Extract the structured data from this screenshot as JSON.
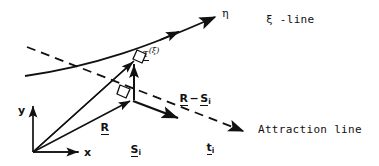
{
  "figure": {
    "background_color": "#ffffff",
    "stroke_color": "#111111",
    "width": 379,
    "height": 166
  },
  "labels": {
    "eta": "η",
    "xi_line": "ξ -line",
    "attraction_line": "Attraction line",
    "tau_xi_base": "τ",
    "tau_xi_sup": "(ξ)",
    "r_minus_si_r": "R",
    "r_minus_si_minus": "−",
    "r_minus_si_s": "S",
    "r_minus_si_sub": "i",
    "r_vector": "R",
    "s_vector": "S",
    "s_vector_sub": "i",
    "t_vector": "t",
    "t_vector_sub": "i",
    "axis_x": "x",
    "axis_y": "y"
  },
  "geometry": {
    "origin": {
      "x": 33,
      "y": 152
    },
    "xi_line_curve": {
      "start": {
        "x": 25,
        "y": 76
      },
      "control1": {
        "x": 95,
        "y": 66
      },
      "control2": {
        "x": 150,
        "y": 46
      },
      "end": {
        "x": 218,
        "y": 16
      },
      "mid_arrow_at": {
        "x": 178,
        "y": 33
      },
      "end_arrow_label": "η"
    },
    "attraction_line_dashed": {
      "start": {
        "x": 27,
        "y": 47
      },
      "end": {
        "x": 247,
        "y": 133
      },
      "dash_pattern": "8,6",
      "arrow_end": {
        "x": 247,
        "y": 133
      }
    },
    "vector_R": {
      "from": {
        "x": 33,
        "y": 152
      },
      "to": {
        "x": 136,
        "y": 59
      }
    },
    "vector_S_i": {
      "from": {
        "x": 33,
        "y": 152
      },
      "to": {
        "x": 133,
        "y": 100
      }
    },
    "vector_R_minus_S": {
      "from": {
        "x": 134,
        "y": 99
      },
      "to": {
        "x": 134,
        "y": 62
      }
    },
    "vector_t_i": {
      "from": {
        "x": 133,
        "y": 100
      },
      "to": {
        "x": 180,
        "y": 118
      }
    },
    "axis_x_arrow": {
      "from": {
        "x": 33,
        "y": 152
      },
      "to": {
        "x": 83,
        "y": 152
      }
    },
    "axis_y_arrow": {
      "from": {
        "x": 33,
        "y": 152
      },
      "to": {
        "x": 33,
        "y": 103
      }
    },
    "right_angle_upper": {
      "x": 136,
      "y": 57,
      "size": 9
    },
    "right_angle_lower": {
      "x": 124,
      "y": 88,
      "size": 9
    }
  }
}
